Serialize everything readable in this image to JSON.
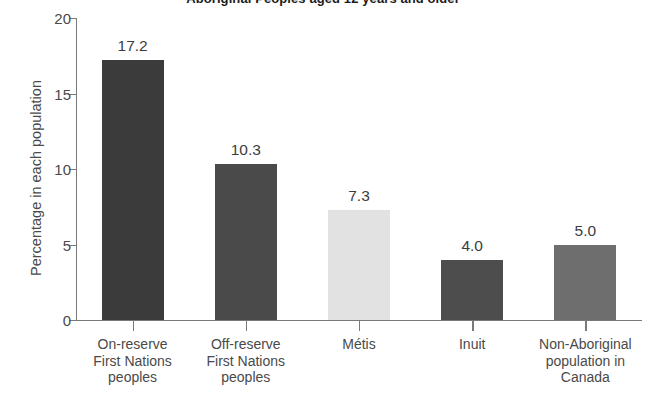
{
  "chart_data": {
    "type": "bar",
    "title": "Aboriginal Peoples aged 12 years and older",
    "xlabel": "",
    "ylabel": "Percentage in each population",
    "ylim": [
      0,
      20
    ],
    "yticks": [
      0,
      5,
      10,
      15,
      20
    ],
    "ytick_labels": [
      "0",
      "5",
      "10",
      "15",
      "20"
    ],
    "grid": false,
    "legend": "none",
    "categories": [
      "On-reserve First Nations peoples",
      "Off-reserve First Nations peoples",
      "Métis",
      "Inuit",
      "Non-Aboriginal population in Canada"
    ],
    "category_lines": [
      [
        "On-reserve",
        "First Nations",
        "peoples"
      ],
      [
        "Off-reserve",
        "First Nations",
        "peoples"
      ],
      [
        "Métis"
      ],
      [
        "Inuit"
      ],
      [
        "Non-Aboriginal",
        "population in",
        "Canada"
      ]
    ],
    "values": [
      17.2,
      10.3,
      7.3,
      4.0,
      5.0
    ],
    "value_labels": [
      "17.2",
      "10.3",
      "7.3",
      "4.0",
      "5.0"
    ],
    "bar_colors": [
      "#3b3b3b",
      "#4a4a4a",
      "#e2e2e2",
      "#4d4d4d",
      "#6e6e6e"
    ]
  },
  "axis": {
    "axis_color": "#7a7a7a"
  }
}
